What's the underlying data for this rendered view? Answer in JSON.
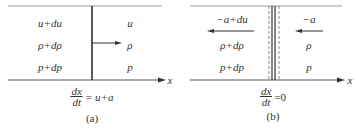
{
  "panels": [
    {
      "id": "a",
      "caption": "(a)",
      "left_labels": [
        "u+du",
        "ρ+dρ",
        "p+dp"
      ],
      "right_labels": [
        "u",
        "ρ",
        "p"
      ],
      "axis_label": "x",
      "equation": {
        "num": "dx",
        "den": "dt",
        "rhs": "= u+a"
      },
      "arrow_direction": "right"
    },
    {
      "id": "b",
      "caption": "(b)",
      "left_labels": [
        "−a+du",
        "ρ+dρ",
        "p+dp"
      ],
      "right_labels": [
        "−a",
        "ρ",
        "p"
      ],
      "axis_label": "x",
      "equation": {
        "num": "dx",
        "den": "dt",
        "rhs": "=0"
      },
      "arrow_direction": "left"
    }
  ],
  "colors": {
    "line": "#333333",
    "dashed": "#888888",
    "text": "#333333"
  }
}
